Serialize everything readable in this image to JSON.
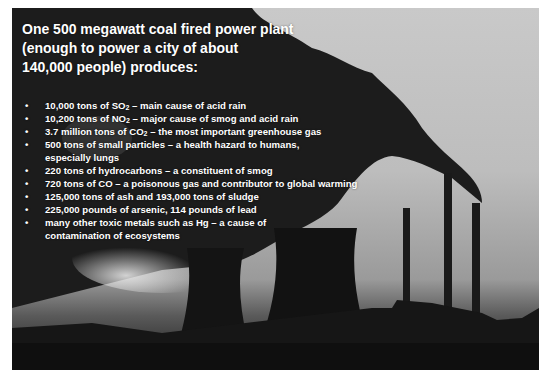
{
  "slide": {
    "title_lines": [
      "One 500 megawatt coal fired power plant",
      "(enough to power a city of about",
      "140,000 people) produces:"
    ],
    "bullet_glyph": "•",
    "bullets": [
      {
        "pre": "10,000 tons of SO",
        "sub": "2",
        "post": " – main cause of acid rain"
      },
      {
        "pre": "10,200 tons of NO",
        "sub": "2",
        "post": " – major cause of smog and acid rain"
      },
      {
        "pre": "3.7 million tons of CO",
        "sub": "2",
        "post": " – the most important greenhouse gas"
      },
      {
        "pre": "500 tons of small particles – a health hazard to humans, especially lungs",
        "sub": "",
        "post": ""
      },
      {
        "pre": "220 tons of hydrocarbons – a constituent of smog",
        "sub": "",
        "post": ""
      },
      {
        "pre": "720 tons of CO – a poisonous gas and contributor to global warming",
        "sub": "",
        "post": ""
      },
      {
        "pre": "125,000 tons of ash and 193,000 tons of sludge",
        "sub": "",
        "post": ""
      },
      {
        "pre": "225,000 pounds of arsenic, 114 pounds of lead",
        "sub": "",
        "post": ""
      },
      {
        "pre": "many other toxic metals such as Hg – a cause of contamination of ecosystems",
        "sub": "",
        "post": ""
      }
    ]
  },
  "background": {
    "subject": "coal power plant silhouette with cooling towers, smokestacks and smoke plumes",
    "colors": {
      "sky": "#c4c4c4",
      "smoke": "#1e1e1e",
      "ground": "#141414"
    }
  }
}
